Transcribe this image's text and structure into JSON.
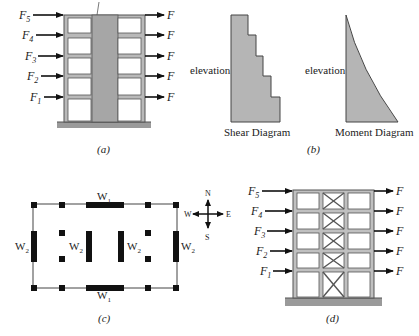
{
  "panels": {
    "a": {
      "caption": "(a)",
      "left_forces": [
        "F5",
        "F4",
        "F3",
        "F2",
        "F1"
      ],
      "right_forces": [
        "F",
        "F",
        "F",
        "F",
        "F"
      ],
      "floors": 5
    },
    "b": {
      "caption": "(b)",
      "shear": {
        "title": "Shear Diagram",
        "axis_label": "elevation"
      },
      "moment": {
        "title": "Moment Diagram",
        "axis_label": "elevation"
      }
    },
    "c": {
      "caption": "(c)",
      "walls": {
        "top": "W1",
        "bottom": "W1",
        "sides": [
          "W2",
          "W2",
          "W2",
          "W2"
        ]
      },
      "compass": {
        "n": "N",
        "s": "S",
        "e": "E",
        "w": "W"
      }
    },
    "d": {
      "caption": "(d)",
      "left_forces": [
        "F5",
        "F4",
        "F3",
        "F2",
        "F1"
      ],
      "right_forces": [
        "F",
        "F",
        "F",
        "F",
        "F"
      ],
      "floors": 5
    }
  },
  "colors": {
    "fill_gray": "#a9a9a9",
    "frame": "#8a8a8a",
    "line": "#111111"
  }
}
